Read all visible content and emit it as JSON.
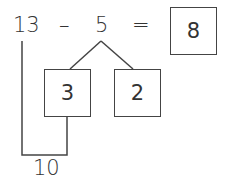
{
  "equation": {
    "minuend": "13",
    "operator": "–",
    "subtrahend": "5",
    "equals": "=",
    "result": "8"
  },
  "decomposition": {
    "parts": [
      "3",
      "2"
    ]
  },
  "make_ten": {
    "label": "10"
  },
  "colors": {
    "line": "#444444",
    "text": "#333333",
    "background": "#ffffff"
  }
}
